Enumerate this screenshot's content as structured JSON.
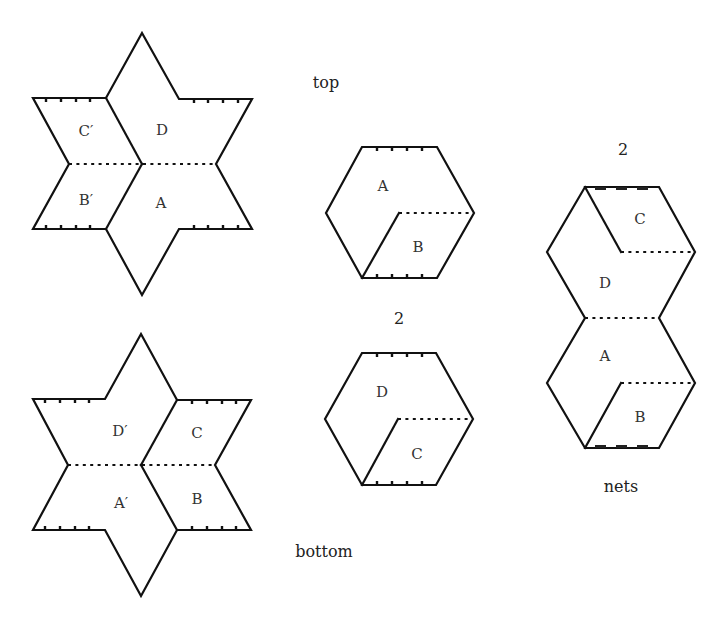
{
  "captions": {
    "top": "top",
    "bottom": "bottom",
    "count_hex": "2",
    "count_net": "2",
    "nets": "nets"
  },
  "top_star": {
    "labels": {
      "upper_left": "C′",
      "upper_right": "D",
      "lower_left": "B′",
      "lower_right": "A"
    }
  },
  "bottom_star": {
    "labels": {
      "upper_left": "D′",
      "upper_right": "C",
      "lower_left": "A′",
      "lower_right": "B"
    }
  },
  "hexagon_1": {
    "labels": {
      "upper": "A",
      "lower": "B"
    }
  },
  "hexagon_2": {
    "labels": {
      "upper": "D",
      "lower": "C"
    }
  },
  "net": {
    "labels": {
      "top": "C",
      "upper": "D",
      "lower": "A",
      "bottom": "B"
    }
  },
  "colors": {
    "line": "#111111",
    "text": "#333333",
    "background": "#ffffff"
  }
}
